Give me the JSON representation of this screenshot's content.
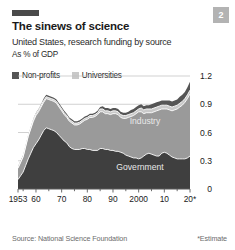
{
  "page_badge": "2",
  "header": {
    "title": "The sinews of science",
    "subtitle": "United States, research funding by source",
    "units": "As % of GDP"
  },
  "footer": {
    "source": "Source: National Science Foundation",
    "note": "*Estimate"
  },
  "colors": {
    "government": "#3f3f3f",
    "industry": "#9a9a9a",
    "universities": "#c9c9c9",
    "nonprofits": "#555555",
    "separator": "#ffffff",
    "grid": "#bdbdbd",
    "axis": "#5a5a5a",
    "badge_bg": "#b3b3b3",
    "rule": "#4a4a4a"
  },
  "chart_data": {
    "type": "area",
    "stacked": true,
    "title": "The sinews of science",
    "subtitle": "United States, research funding by source",
    "xlabel": "",
    "ylabel": "As % of GDP",
    "ylim": [
      0,
      1.2
    ],
    "yticks": [
      0,
      0.3,
      0.6,
      0.9,
      1.2
    ],
    "ytick_labels": [
      "0",
      "0.3",
      "0.6",
      "0.9",
      "1.2"
    ],
    "grid": true,
    "legend_position": "top-left",
    "legend": [
      "Non-profits",
      "Universities"
    ],
    "inline_labels": [
      "Industry",
      "Government"
    ],
    "xticks": [
      1953,
      1960,
      1970,
      1980,
      1990,
      2000,
      2010,
      2020
    ],
    "xtick_labels": [
      "1953",
      "60",
      "70",
      "80",
      "90",
      "2000",
      "10",
      "20*"
    ],
    "x": [
      1953,
      1954,
      1955,
      1956,
      1957,
      1958,
      1959,
      1960,
      1961,
      1962,
      1963,
      1964,
      1965,
      1966,
      1967,
      1968,
      1969,
      1970,
      1971,
      1972,
      1973,
      1974,
      1975,
      1976,
      1977,
      1978,
      1979,
      1980,
      1981,
      1982,
      1983,
      1984,
      1985,
      1986,
      1987,
      1988,
      1989,
      1990,
      1991,
      1992,
      1993,
      1994,
      1995,
      1996,
      1997,
      1998,
      1999,
      2000,
      2001,
      2002,
      2003,
      2004,
      2005,
      2006,
      2007,
      2008,
      2009,
      2010,
      2011,
      2012,
      2013,
      2014,
      2015,
      2016,
      2017,
      2018,
      2019,
      2020
    ],
    "series": [
      {
        "name": "Government",
        "color": "#3f3f3f",
        "values": [
          0.1,
          0.14,
          0.18,
          0.25,
          0.32,
          0.38,
          0.44,
          0.48,
          0.52,
          0.57,
          0.62,
          0.65,
          0.64,
          0.63,
          0.62,
          0.6,
          0.57,
          0.54,
          0.51,
          0.49,
          0.45,
          0.43,
          0.42,
          0.42,
          0.42,
          0.43,
          0.43,
          0.42,
          0.42,
          0.41,
          0.41,
          0.41,
          0.43,
          0.43,
          0.42,
          0.42,
          0.41,
          0.41,
          0.4,
          0.4,
          0.39,
          0.38,
          0.36,
          0.35,
          0.34,
          0.33,
          0.33,
          0.32,
          0.33,
          0.35,
          0.37,
          0.38,
          0.37,
          0.36,
          0.35,
          0.35,
          0.38,
          0.39,
          0.38,
          0.36,
          0.34,
          0.33,
          0.32,
          0.32,
          0.32,
          0.32,
          0.33,
          0.35
        ]
      },
      {
        "name": "Industry",
        "color": "#9a9a9a",
        "values": [
          0.12,
          0.14,
          0.16,
          0.2,
          0.24,
          0.26,
          0.28,
          0.3,
          0.3,
          0.3,
          0.3,
          0.31,
          0.31,
          0.31,
          0.31,
          0.31,
          0.3,
          0.29,
          0.28,
          0.27,
          0.27,
          0.27,
          0.26,
          0.26,
          0.27,
          0.28,
          0.3,
          0.32,
          0.34,
          0.35,
          0.36,
          0.38,
          0.39,
          0.39,
          0.38,
          0.38,
          0.38,
          0.39,
          0.4,
          0.39,
          0.37,
          0.37,
          0.39,
          0.41,
          0.43,
          0.45,
          0.47,
          0.5,
          0.49,
          0.45,
          0.44,
          0.43,
          0.44,
          0.46,
          0.48,
          0.49,
          0.47,
          0.46,
          0.47,
          0.48,
          0.49,
          0.51,
          0.53,
          0.55,
          0.57,
          0.6,
          0.63,
          0.66
        ]
      },
      {
        "name": "Universities",
        "color": "#c9c9c9",
        "values": [
          0.01,
          0.01,
          0.01,
          0.01,
          0.01,
          0.01,
          0.02,
          0.02,
          0.02,
          0.02,
          0.02,
          0.02,
          0.02,
          0.02,
          0.02,
          0.02,
          0.02,
          0.02,
          0.02,
          0.02,
          0.02,
          0.02,
          0.02,
          0.02,
          0.02,
          0.02,
          0.02,
          0.02,
          0.02,
          0.02,
          0.02,
          0.02,
          0.03,
          0.03,
          0.03,
          0.03,
          0.03,
          0.03,
          0.03,
          0.03,
          0.03,
          0.03,
          0.03,
          0.03,
          0.03,
          0.03,
          0.03,
          0.03,
          0.04,
          0.04,
          0.04,
          0.04,
          0.04,
          0.04,
          0.04,
          0.04,
          0.04,
          0.04,
          0.04,
          0.04,
          0.04,
          0.04,
          0.04,
          0.04,
          0.04,
          0.04,
          0.04,
          0.04
        ]
      },
      {
        "name": "Non-profits",
        "color": "#555555",
        "values": [
          0.01,
          0.01,
          0.01,
          0.01,
          0.01,
          0.01,
          0.01,
          0.01,
          0.01,
          0.01,
          0.02,
          0.02,
          0.02,
          0.02,
          0.02,
          0.02,
          0.02,
          0.02,
          0.02,
          0.02,
          0.02,
          0.02,
          0.02,
          0.02,
          0.02,
          0.02,
          0.02,
          0.02,
          0.02,
          0.02,
          0.02,
          0.02,
          0.02,
          0.03,
          0.03,
          0.03,
          0.03,
          0.03,
          0.03,
          0.03,
          0.03,
          0.03,
          0.03,
          0.03,
          0.04,
          0.04,
          0.04,
          0.04,
          0.04,
          0.04,
          0.04,
          0.04,
          0.05,
          0.05,
          0.05,
          0.05,
          0.05,
          0.05,
          0.05,
          0.06,
          0.06,
          0.06,
          0.06,
          0.07,
          0.07,
          0.07,
          0.08,
          0.09
        ]
      }
    ]
  }
}
